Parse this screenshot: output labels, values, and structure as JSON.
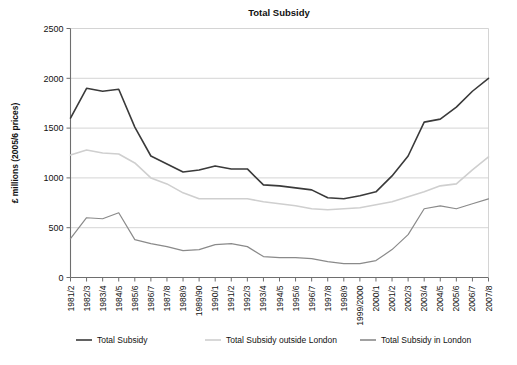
{
  "chart_data": {
    "type": "line",
    "title": "Total Subsidy",
    "xlabel": "",
    "ylabel": "£ millions (2005/6 prices)",
    "ylim": [
      0,
      2500
    ],
    "yticks": [
      0,
      500,
      1000,
      1500,
      2000,
      2500
    ],
    "grid": true,
    "legend_position": "bottom",
    "categories": [
      "1981/2",
      "1982/3",
      "1983/4",
      "1984/5",
      "1985/6",
      "1986/7",
      "1987/8",
      "1988/9",
      "1989/90",
      "1990/1",
      "1991/2",
      "1992/3",
      "1993/4",
      "1994/5",
      "1995/6",
      "1996/7",
      "1997/8",
      "1998/9",
      "1999/2000",
      "2000/1",
      "2001/2",
      "2002/3",
      "2003/4",
      "2004/5",
      "2005/6",
      "2006/7",
      "2007/8"
    ],
    "series": [
      {
        "name": "Total Subsidy",
        "color": "#3a3a3a",
        "width": 1.6,
        "values": [
          1600,
          1900,
          1870,
          1890,
          1510,
          1220,
          1140,
          1060,
          1080,
          1120,
          1090,
          1090,
          930,
          920,
          900,
          880,
          800,
          790,
          820,
          860,
          1020,
          1220,
          1560,
          1590,
          1710,
          1870,
          2000
        ]
      },
      {
        "name": "Total  Subsidy outside London",
        "color": "#cfcfcf",
        "width": 1.6,
        "values": [
          1230,
          1280,
          1250,
          1240,
          1150,
          1000,
          940,
          850,
          790,
          790,
          790,
          790,
          760,
          740,
          720,
          690,
          680,
          690,
          700,
          730,
          760,
          810,
          860,
          920,
          940,
          1080,
          1210
        ]
      },
      {
        "name": "Total  Subsidy in London",
        "color": "#8a8a8a",
        "width": 1.2,
        "values": [
          390,
          600,
          590,
          650,
          380,
          340,
          310,
          270,
          280,
          330,
          340,
          310,
          210,
          200,
          200,
          190,
          160,
          140,
          140,
          170,
          280,
          430,
          690,
          720,
          690,
          740,
          790
        ]
      }
    ]
  },
  "legend": {
    "items": [
      {
        "label": "Total Subsidy",
        "color": "#3a3a3a"
      },
      {
        "label": "Total  Subsidy outside London",
        "color": "#cfcfcf"
      },
      {
        "label": "Total  Subsidy in London",
        "color": "#8a8a8a"
      }
    ]
  }
}
